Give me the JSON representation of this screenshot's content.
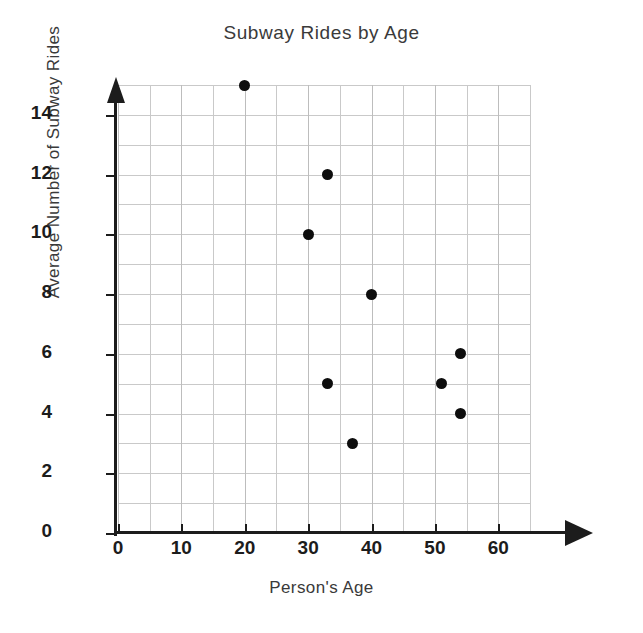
{
  "chart_data": {
    "type": "scatter",
    "title": "Subway Rides by Age",
    "xlabel": "Person's Age",
    "ylabel": "Average Number of Subway Rides",
    "xlim": [
      0,
      65
    ],
    "ylim": [
      0,
      15
    ],
    "x_ticks": [
      0,
      10,
      20,
      30,
      40,
      50,
      60
    ],
    "y_ticks": [
      0,
      2,
      4,
      6,
      8,
      10,
      12,
      14
    ],
    "x_tick_labels": [
      "0",
      "10",
      "20",
      "30",
      "40",
      "50",
      "60"
    ],
    "y_tick_labels": [
      "0",
      "2",
      "4",
      "6",
      "8",
      "10",
      "12",
      "14"
    ],
    "grid": true,
    "grid_x_step": 5,
    "grid_y_step": 1,
    "legend": null,
    "marker_color": "#0d0d0d",
    "axis_color": "#1c1c1c",
    "grid_color": "#c9c9c9",
    "points": [
      {
        "x": 20,
        "y": 15
      },
      {
        "x": 33,
        "y": 12
      },
      {
        "x": 30,
        "y": 10
      },
      {
        "x": 40,
        "y": 8
      },
      {
        "x": 54,
        "y": 6
      },
      {
        "x": 33,
        "y": 5
      },
      {
        "x": 51,
        "y": 5
      },
      {
        "x": 54,
        "y": 4
      },
      {
        "x": 37,
        "y": 3
      }
    ]
  }
}
